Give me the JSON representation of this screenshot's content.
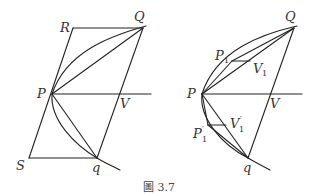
{
  "caption": "圖 3.7",
  "left_figure": {
    "labels": {
      "R": "R",
      "Q": "Q",
      "P": "P",
      "V": "V",
      "S": "S",
      "q": "q"
    }
  },
  "right_figure": {
    "labels": {
      "Q": "Q",
      "P": "P",
      "V": "V",
      "q": "q",
      "P1": "P",
      "P1_sub": "1",
      "V1": "V",
      "V1_sub": "1",
      "P1p": "P",
      "P1p_sub": "1",
      "P1p_prime": "′",
      "V1p": "V",
      "V1p_sub": "1",
      "V1p_prime": "′"
    }
  }
}
